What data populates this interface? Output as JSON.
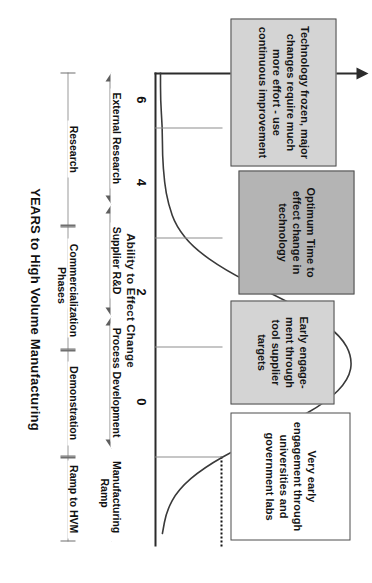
{
  "chart_data": {
    "type": "line",
    "title": "",
    "xlabel": "YEARS to High Volume Manufacturing",
    "ylabel": "Ability to Effect Change",
    "xlim": [
      7,
      -1.6
    ],
    "ylim": [
      0,
      1
    ],
    "grid": false,
    "legend": "none",
    "x_tick_labels": [
      "6",
      "4",
      "2",
      "0"
    ],
    "x_tick_values": [
      6,
      4,
      2,
      0
    ],
    "series": [
      {
        "name": "Ability to Effect Change",
        "x": [
          7.0,
          6.5,
          6.0,
          5.5,
          5.0,
          4.6,
          4.2,
          3.8,
          3.4,
          3.0,
          2.6,
          2.2,
          1.8,
          1.4,
          1.0,
          0.6,
          0.2,
          -0.2,
          -0.6,
          -1.0,
          -1.4
        ],
        "y": [
          0.01,
          0.01,
          0.02,
          0.02,
          0.03,
          0.05,
          0.09,
          0.18,
          0.34,
          0.56,
          0.78,
          0.93,
          0.99,
          0.97,
          0.86,
          0.66,
          0.43,
          0.23,
          0.1,
          0.04,
          0.02
        ]
      }
    ],
    "reference_line": {
      "label": "0",
      "x": 0,
      "style": "dotted"
    },
    "annotations": [
      "Technology frozen, major changes require much more effort - use continuous improvement",
      "Optimum Time to effect change in technology",
      "Early engage-ment through tool supplier targets",
      "Very early engagement through universities and government labs"
    ]
  },
  "axes": {
    "y_title": "Ability to Effect Change",
    "x_title": "YEARS to High Volume Manufacturing",
    "ticks": [
      {
        "label": "6",
        "value": 6
      },
      {
        "label": "4",
        "value": 4
      },
      {
        "label": "2",
        "value": 2
      },
      {
        "label": "0",
        "value": 0
      }
    ]
  },
  "phase_bands": [
    {
      "label": "External Research",
      "from": 7.0,
      "to": 4.6
    },
    {
      "label": "Supplier R&D",
      "from": 4.6,
      "to": 2.55
    },
    {
      "label": "Process Development",
      "from": 2.55,
      "to": 0.15
    },
    {
      "label": "Manufacturing Ramp",
      "from": 0.15,
      "to": -1.55
    }
  ],
  "commercialization_bands": [
    {
      "label": "Research",
      "from": 7.0,
      "to": 4.2
    },
    {
      "label": "Commercialization Phases",
      "from": 4.2,
      "to": 1.95
    },
    {
      "label": "Demonstration",
      "from": 1.95,
      "to": 0.0
    },
    {
      "label": "Ramp to HVM",
      "from": 0.0,
      "to": -1.55
    }
  ],
  "callouts": [
    {
      "id": "technology-frozen",
      "text": "Technology frozen, major changes require much more effort - use continuous improvement",
      "style": "light"
    },
    {
      "id": "optimum-time",
      "text": "Optimum Time to effect change in technology",
      "style": "dark"
    },
    {
      "id": "early-engagement",
      "text": "Early engage-ment through tool supplier targets",
      "style": "light"
    },
    {
      "id": "very-early-engagement",
      "text": "Very early engagement through universities and government labs",
      "style": "plain"
    }
  ],
  "colors": {
    "axis": "#2b2b2b",
    "curve": "#3a3a3a",
    "band_arrow": "#5e5e5e",
    "callout_light": "#d4d4d4",
    "callout_dark": "#b4b4b4",
    "background": "#ffffff"
  }
}
